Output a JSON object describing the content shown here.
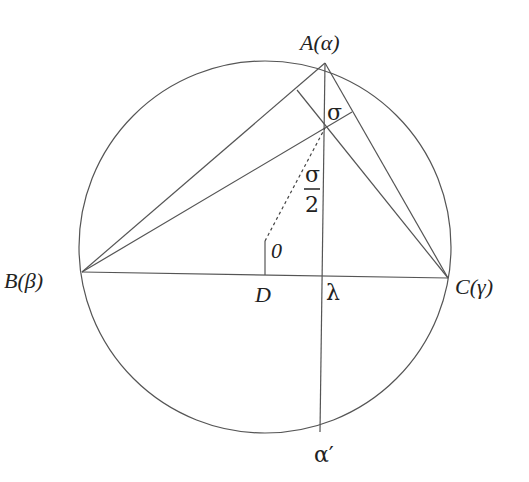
{
  "diagram": {
    "type": "geometry-circumcircle-triangle",
    "labels": {
      "A": "A(α)",
      "B": "B(β)",
      "C": "C(γ)",
      "D": "D",
      "O": "0",
      "lambda": "λ",
      "sigma": "σ",
      "sigma_half_num": "σ",
      "sigma_half_den": "2",
      "alpha_prime": "α′"
    },
    "points": {
      "center": [
        265,
        247
      ],
      "A": [
        325,
        63
      ],
      "B": [
        82,
        272
      ],
      "C": [
        448,
        278
      ],
      "sigma": [
        325,
        128
      ],
      "O": [
        265,
        241
      ],
      "D": [
        265,
        275
      ],
      "lambda": [
        323,
        276
      ],
      "alpha_prime": [
        320,
        432
      ],
      "foot_C_on_AB": [
        297,
        90
      ],
      "foot_B_on_AC": [
        352,
        112
      ]
    },
    "circle_radius": 186,
    "colors": {
      "line": "#555555",
      "text": "#222222",
      "background": "#ffffff"
    }
  }
}
